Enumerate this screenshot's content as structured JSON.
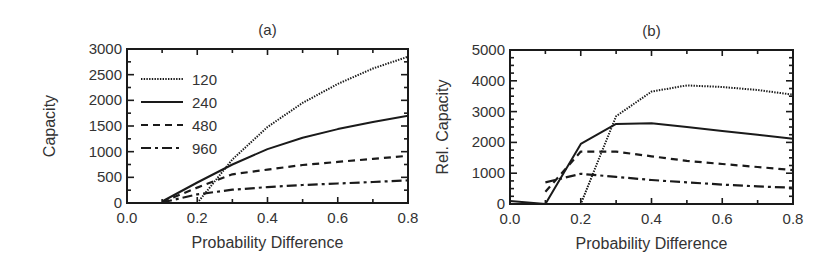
{
  "chart_data": [
    {
      "type": "line",
      "panel_label": "(a)",
      "title": "(a)",
      "xlabel": "Probability Difference",
      "ylabel": "Capacity",
      "xlim": [
        0.0,
        0.8
      ],
      "ylim": [
        0,
        3000
      ],
      "xticks": [
        "0.0",
        "0.2",
        "0.4",
        "0.6",
        "0.8"
      ],
      "yticks": [
        "0",
        "500",
        "1000",
        "1500",
        "2000",
        "2500",
        "3000"
      ],
      "grid": false,
      "legend_position": "upper left inside",
      "series": [
        {
          "name": "120",
          "style": "dotted",
          "x": [
            0.2,
            0.3,
            0.4,
            0.5,
            0.6,
            0.7,
            0.8
          ],
          "values": [
            0,
            850,
            1480,
            1950,
            2320,
            2620,
            2850
          ]
        },
        {
          "name": "240",
          "style": "solid",
          "x": [
            0.1,
            0.2,
            0.3,
            0.4,
            0.5,
            0.6,
            0.7,
            0.8
          ],
          "values": [
            30,
            400,
            750,
            1050,
            1270,
            1440,
            1580,
            1700
          ]
        },
        {
          "name": "480",
          "style": "dashed",
          "x": [
            0.1,
            0.2,
            0.3,
            0.4,
            0.5,
            0.6,
            0.7,
            0.8
          ],
          "values": [
            20,
            300,
            560,
            650,
            740,
            800,
            860,
            920
          ]
        },
        {
          "name": "960",
          "style": "dash-dot",
          "x": [
            0.1,
            0.2,
            0.3,
            0.4,
            0.5,
            0.6,
            0.7,
            0.8
          ],
          "values": [
            10,
            170,
            260,
            310,
            350,
            380,
            410,
            440
          ]
        }
      ]
    },
    {
      "type": "line",
      "panel_label": "(b)",
      "title": "(b)",
      "xlabel": "Probability Difference",
      "ylabel": "Rel. Capacity",
      "xlim": [
        0.0,
        0.8
      ],
      "ylim": [
        0,
        5000
      ],
      "xticks": [
        "0.0",
        "0.2",
        "0.4",
        "0.6",
        "0.8"
      ],
      "yticks": [
        "0",
        "1000",
        "2000",
        "3000",
        "4000",
        "5000"
      ],
      "grid": false,
      "legend_position": "none",
      "series": [
        {
          "name": "120",
          "style": "dotted",
          "x": [
            0.0,
            0.1,
            0.2,
            0.3,
            0.4,
            0.5,
            0.6,
            0.7,
            0.8
          ],
          "values": [
            0,
            0,
            0,
            2850,
            3650,
            3850,
            3800,
            3700,
            3550
          ]
        },
        {
          "name": "240",
          "style": "solid",
          "x": [
            0.0,
            0.1,
            0.2,
            0.3,
            0.4,
            0.5,
            0.6,
            0.7,
            0.8
          ],
          "values": [
            100,
            0,
            1950,
            2600,
            2620,
            2500,
            2370,
            2250,
            2120
          ]
        },
        {
          "name": "480",
          "style": "dashed",
          "x": [
            0.1,
            0.2,
            0.3,
            0.4,
            0.5,
            0.6,
            0.7,
            0.8
          ],
          "values": [
            400,
            1700,
            1700,
            1550,
            1400,
            1300,
            1200,
            1100
          ]
        },
        {
          "name": "960",
          "style": "dash-dot",
          "x": [
            0.1,
            0.2,
            0.3,
            0.4,
            0.5,
            0.6,
            0.7,
            0.8
          ],
          "values": [
            700,
            980,
            880,
            780,
            700,
            630,
            570,
            530
          ]
        }
      ]
    }
  ],
  "layout": {
    "panels": [
      {
        "left": 127,
        "right": 408,
        "top": 49,
        "bottom": 203
      },
      {
        "left": 510,
        "right": 793,
        "top": 50,
        "bottom": 204
      }
    ],
    "line_color": "#1a1a1a",
    "frame_color": "#1a1a1a",
    "text_color": "#333333"
  }
}
